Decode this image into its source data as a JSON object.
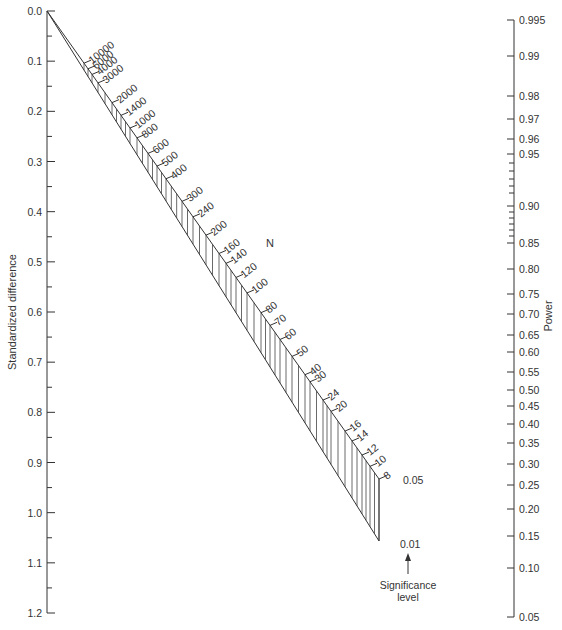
{
  "chart_data": {
    "type": "nomogram",
    "title": "",
    "left_axis": {
      "label": "Standardized difference",
      "ticks": [
        "0.0",
        "0.1",
        "0.2",
        "0.3",
        "0.4",
        "0.5",
        "0.6",
        "0.7",
        "0.8",
        "0.9",
        "1.0",
        "1.1",
        "1.2"
      ],
      "range": [
        0.0,
        1.2
      ],
      "minor_ticks": true
    },
    "right_axis": {
      "label": "Power",
      "ticks": [
        {
          "label": "0.995",
          "y": 20
        },
        {
          "label": "0.99",
          "y": 56
        },
        {
          "label": "0.98",
          "y": 96
        },
        {
          "label": "0.97",
          "y": 119
        },
        {
          "label": "0.96",
          "y": 139
        },
        {
          "label": "0.95",
          "y": 154
        },
        {
          "label": "0.90",
          "y": 206
        },
        {
          "label": "0.85",
          "y": 243
        },
        {
          "label": "0.80",
          "y": 269
        },
        {
          "label": "0.75",
          "y": 294
        },
        {
          "label": "0.70",
          "y": 314
        },
        {
          "label": "0.65",
          "y": 335
        },
        {
          "label": "0.60",
          "y": 352
        },
        {
          "label": "0.55",
          "y": 372
        },
        {
          "label": "0.50",
          "y": 390
        },
        {
          "label": "0.45",
          "y": 406
        },
        {
          "label": "0.40",
          "y": 424
        },
        {
          "label": "0.35",
          "y": 443
        },
        {
          "label": "0.30",
          "y": 464
        },
        {
          "label": "0.25",
          "y": 485
        },
        {
          "label": "0.20",
          "y": 509
        },
        {
          "label": "0.15",
          "y": 536
        },
        {
          "label": "0.10",
          "y": 568
        },
        {
          "label": "0.05",
          "y": 617
        }
      ],
      "minor_ticks_y": [
        163,
        171,
        179,
        186,
        193,
        212,
        218,
        224,
        230,
        236
      ]
    },
    "n_scale": {
      "label": "N",
      "ticks": [
        {
          "label": "10000",
          "x": 84,
          "y": 56
        },
        {
          "label": "6000",
          "x": 88,
          "y": 62
        },
        {
          "label": "4000",
          "x": 92,
          "y": 69
        },
        {
          "label": "3000",
          "x": 98,
          "y": 78
        },
        {
          "label": "2000",
          "x": 112,
          "y": 97
        },
        {
          "label": "1400",
          "x": 121,
          "y": 109
        },
        {
          "label": "1000",
          "x": 130,
          "y": 121
        },
        {
          "label": "800",
          "x": 137,
          "y": 134
        },
        {
          "label": "600",
          "x": 148,
          "y": 147
        },
        {
          "label": "500",
          "x": 157,
          "y": 160
        },
        {
          "label": "400",
          "x": 166,
          "y": 172
        },
        {
          "label": "300",
          "x": 182,
          "y": 196
        },
        {
          "label": "240",
          "x": 193,
          "y": 211
        },
        {
          "label": "200",
          "x": 206,
          "y": 227
        },
        {
          "label": "160",
          "x": 219,
          "y": 247
        },
        {
          "label": "140",
          "x": 226,
          "y": 258
        },
        {
          "label": "120",
          "x": 236,
          "y": 272
        },
        {
          "label": "100",
          "x": 247,
          "y": 288
        },
        {
          "label": "80",
          "x": 261,
          "y": 308
        },
        {
          "label": "70",
          "x": 270,
          "y": 321
        },
        {
          "label": "60",
          "x": 280,
          "y": 336
        },
        {
          "label": "50",
          "x": 292,
          "y": 353
        },
        {
          "label": "40",
          "x": 305,
          "y": 372
        },
        {
          "label": "30",
          "x": 310,
          "y": 375
        },
        {
          "label": "24",
          "x": 323,
          "y": 393
        },
        {
          "label": "20",
          "x": 331,
          "y": 407
        },
        {
          "label": "16",
          "x": 345,
          "y": 423
        },
        {
          "label": "14",
          "x": 352,
          "y": 433
        },
        {
          "label": "12",
          "x": 362,
          "y": 447
        },
        {
          "label": "10",
          "x": 370,
          "y": 461
        },
        {
          "label": "8",
          "x": 379,
          "y": 479
        }
      ]
    },
    "significance": {
      "label_line1": "Significance",
      "label_line2": "level",
      "levels": [
        "0.05",
        "0.01"
      ]
    }
  }
}
